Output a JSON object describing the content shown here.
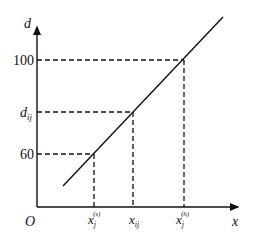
{
  "diagram": {
    "axes": {
      "x_label": "x",
      "y_label": "d",
      "origin_label": "O"
    },
    "y_ticks": [
      {
        "label": "100",
        "y": 60
      },
      {
        "label_main": "d",
        "label_sub": "ij",
        "y": 112
      },
      {
        "label": "60",
        "y": 154
      }
    ],
    "x_ticks": [
      {
        "main": "x",
        "sub": "j",
        "sup": "(s)",
        "x": 94
      },
      {
        "main": "x",
        "sub": "ij",
        "x": 133
      },
      {
        "main": "x",
        "sub": "j",
        "sup": "(h)",
        "x": 184
      }
    ],
    "line": {
      "x1": 63,
      "y1": 186,
      "x2": 223,
      "y2": 17
    },
    "colors": {
      "stroke": "#111111",
      "background": "#ffffff"
    }
  }
}
